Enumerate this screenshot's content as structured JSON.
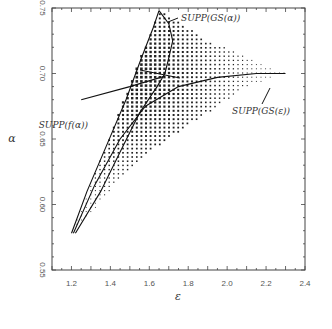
{
  "chart_data": {
    "type": "scatter",
    "title": "",
    "xlabel": "ε",
    "ylabel": "α",
    "xlim": [
      1.1,
      2.4
    ],
    "ylim": [
      0.55,
      0.75
    ],
    "x_ticks": [
      "1.2",
      "1.4",
      "1.6",
      "1.8",
      "2.0",
      "2.2",
      "2.4"
    ],
    "y_ticks": [
      "0.55",
      "0.60",
      "0.65",
      "0.70",
      "0.75"
    ],
    "grid": false,
    "legend": null,
    "annotations": [
      {
        "text": "SUPP(GS(α))",
        "x": 1.72,
        "y": 0.738
      },
      {
        "text": "SUPP(f(α))",
        "x": 1.26,
        "y": 0.676
      },
      {
        "text": "SUPP(GS(ε))",
        "x": 2.2,
        "y": 0.685
      }
    ],
    "series": [
      {
        "name": "SUPP(GS(ε)) dotted region",
        "kind": "dot-field",
        "outline": [
          [
            1.2,
            0.578
          ],
          [
            1.65,
            0.748
          ],
          [
            1.72,
            0.742
          ],
          [
            1.9,
            0.725
          ],
          [
            2.3,
            0.7
          ],
          [
            2.1,
            0.69
          ],
          [
            1.8,
            0.66
          ],
          [
            1.6,
            0.64
          ],
          [
            1.45,
            0.62
          ],
          [
            1.25,
            0.585
          ]
        ]
      },
      {
        "name": "SUPP(GS(α)) curve (left branch)",
        "kind": "line",
        "points": [
          [
            1.2,
            0.578
          ],
          [
            1.28,
            0.61
          ],
          [
            1.38,
            0.645
          ],
          [
            1.48,
            0.68
          ],
          [
            1.56,
            0.712
          ],
          [
            1.62,
            0.735
          ],
          [
            1.65,
            0.748
          ]
        ]
      },
      {
        "name": "SUPP(GS(α)) curve (right wiggly branch)",
        "kind": "line",
        "points": [
          [
            1.65,
            0.748
          ],
          [
            1.7,
            0.738
          ],
          [
            1.72,
            0.725
          ],
          [
            1.7,
            0.712
          ],
          [
            1.68,
            0.7
          ],
          [
            1.64,
            0.69
          ],
          [
            1.55,
            0.67
          ],
          [
            1.45,
            0.64
          ],
          [
            1.35,
            0.61
          ],
          [
            1.22,
            0.578
          ]
        ]
      },
      {
        "name": "SUPP(GS(ε)) curve",
        "kind": "line",
        "points": [
          [
            1.21,
            0.578
          ],
          [
            1.32,
            0.615
          ],
          [
            1.45,
            0.65
          ],
          [
            1.58,
            0.675
          ],
          [
            1.75,
            0.69
          ],
          [
            1.95,
            0.697
          ],
          [
            2.15,
            0.7
          ],
          [
            2.3,
            0.7
          ]
        ]
      },
      {
        "name": "SUPP(f(α)) line",
        "kind": "line",
        "points": [
          [
            1.25,
            0.68
          ],
          [
            1.5,
            0.69
          ],
          [
            1.68,
            0.698
          ]
        ]
      }
    ]
  }
}
